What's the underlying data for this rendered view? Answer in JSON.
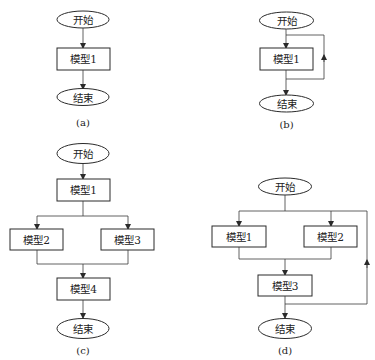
{
  "diagrams": {
    "a": {
      "caption": "(a)",
      "start": "开始",
      "nodes": [
        "模型1"
      ],
      "end": "结束",
      "structure": "sequential"
    },
    "b": {
      "caption": "(b)",
      "start": "开始",
      "nodes": [
        "模型1"
      ],
      "end": "结束",
      "structure": "loop"
    },
    "c": {
      "caption": "(c)",
      "start": "开始",
      "nodes": [
        "模型1",
        "模型2",
        "模型3",
        "模型4"
      ],
      "end": "结束",
      "structure": "split-merge"
    },
    "d": {
      "caption": "(d)",
      "start": "开始",
      "nodes": [
        "模型1",
        "模型2",
        "模型3"
      ],
      "end": "结束",
      "structure": "parallel-with-loop"
    }
  },
  "colors": {
    "stroke": "#2a2a2a",
    "background": "#ffffff"
  }
}
